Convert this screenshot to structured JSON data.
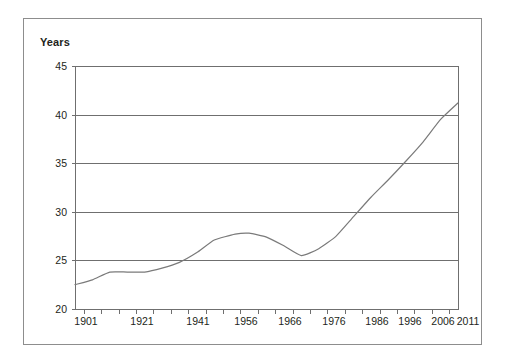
{
  "figure": {
    "frame_color": "#8d8d8d",
    "background": "#ffffff"
  },
  "chart_data": {
    "type": "line",
    "title": "",
    "subtitle": "",
    "xlabel": "",
    "ylabel": "Years",
    "ylim": [
      20,
      45
    ],
    "xlim": [
      1901,
      2011
    ],
    "grid": true,
    "legend": false,
    "legend_position": "none",
    "line_color": "#7a7a7a",
    "y_ticks": [
      20,
      25,
      30,
      35,
      40,
      45
    ],
    "y_tick_labels": [
      "20",
      "25",
      "30",
      "35",
      "40",
      "45"
    ],
    "x_tick_labels": [
      "1901",
      "1921",
      "1941",
      "1956",
      "1966",
      "1976",
      "1986",
      "1996",
      "2006",
      "2011"
    ],
    "x_minor_tick_count": 22,
    "series": [
      {
        "name": "Median age",
        "x": [
          1901,
          1906,
          1911,
          1916,
          1921,
          1926,
          1931,
          1936,
          1941,
          1947,
          1951,
          1956,
          1961,
          1966,
          1971,
          1976,
          1981,
          1986,
          1991,
          1996,
          2001,
          2006,
          2011
        ],
        "values": [
          22.5,
          23.0,
          23.8,
          23.8,
          23.8,
          24.2,
          24.8,
          25.8,
          27.1,
          27.7,
          27.8,
          27.4,
          26.5,
          25.5,
          26.2,
          27.5,
          29.5,
          31.5,
          33.3,
          35.2,
          37.2,
          39.5,
          41.2
        ]
      }
    ],
    "annotations": []
  },
  "geometry": {
    "plot_left": 75,
    "plot_right": 458,
    "plot_top": 66,
    "plot_bottom": 309
  }
}
